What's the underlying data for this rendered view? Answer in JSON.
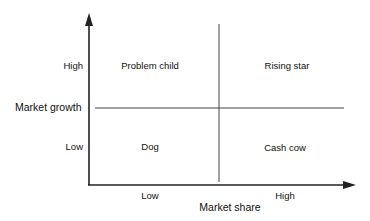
{
  "diagram": {
    "type": "2x2 matrix",
    "y_axis": {
      "title": "Market growth",
      "ticks": [
        "High",
        "Low"
      ]
    },
    "x_axis": {
      "title": "Market share",
      "ticks": [
        "Low",
        "High"
      ]
    },
    "quadrants": {
      "top_left": "Problem child",
      "top_right": "Rising star",
      "bottom_left": "Dog",
      "bottom_right": "Cash cow"
    },
    "colors": {
      "line": "#222222",
      "background": "#ffffff"
    }
  }
}
